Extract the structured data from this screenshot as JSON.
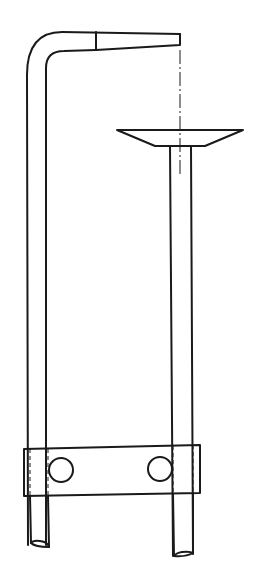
{
  "diagram": {
    "colors": {
      "line": "#1a1a1a",
      "background": "#ffffff"
    },
    "parts": [
      {
        "id": "bent-rod",
        "label": "bent support rod with horizontal arm"
      },
      {
        "id": "center-line",
        "label": "dash-dot center line"
      },
      {
        "id": "funnel",
        "label": "funnel / dish"
      },
      {
        "id": "vertical-rod",
        "label": "vertical rod"
      },
      {
        "id": "clamp-block",
        "label": "clamp block"
      },
      {
        "id": "bolt-hole-left",
        "label": "bolt hole"
      },
      {
        "id": "bolt-hole-right",
        "label": "bolt hole"
      }
    ]
  }
}
